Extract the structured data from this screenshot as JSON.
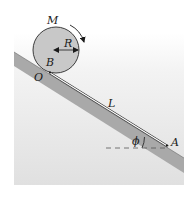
{
  "diagram": {
    "type": "physics-incline",
    "labels": {
      "mass": "M",
      "radius": "R",
      "contact_point": "B",
      "origin": "O",
      "length": "L",
      "angle": "ϕ",
      "end_point": "A"
    },
    "colors": {
      "background_top": "#ffffff",
      "background_bottom": "#e2e2e2",
      "incline_fill": "#a9a9a9",
      "disk_fill": "#c8c8c8",
      "disk_stroke": "#2a2a2a",
      "string": "#ffffff",
      "line": "#1a1a1a",
      "dashed": "#555555"
    },
    "elements": {
      "disk": "uniform disk of mass M and radius R rotating clockwise",
      "incline": "inclined plane at angle phi below horizontal",
      "string": "string of length L from B to A along incline",
      "rotation_arrow": "clockwise arrow near top-right of disk",
      "radius_arrow": "double-headed arrow from center to rim",
      "horizontal_reference": "dashed horizontal line at A"
    }
  }
}
